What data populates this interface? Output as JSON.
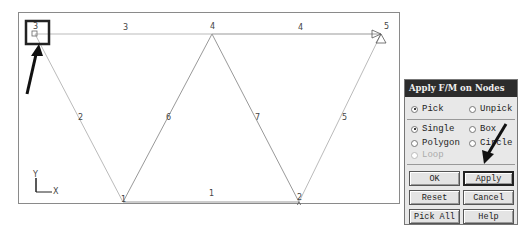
{
  "model": {
    "nodes": [
      {
        "id": "1",
        "label": "1"
      },
      {
        "id": "2",
        "label": "2"
      },
      {
        "id": "3",
        "label": "3"
      },
      {
        "id": "4",
        "label": "4"
      },
      {
        "id": "5",
        "label": "5"
      }
    ],
    "elements": [
      "1",
      "2",
      "3",
      "4",
      "5",
      "6",
      "7"
    ],
    "axis": {
      "x_label": "X",
      "y_label": "Y"
    }
  },
  "panel": {
    "title": "Apply F/M on Nodes",
    "pick_label": "Pick",
    "unpick_label": "Unpick",
    "single_label": "Single",
    "box_label": "Box",
    "polygon_label": "Polygon",
    "circle_label": "Circle",
    "loop_label": "Loop",
    "ok_label": "OK",
    "apply_label": "Apply",
    "reset_label": "Reset",
    "cancel_label": "Cancel",
    "pick_all_label": "Pick All",
    "help_label": "Help"
  }
}
